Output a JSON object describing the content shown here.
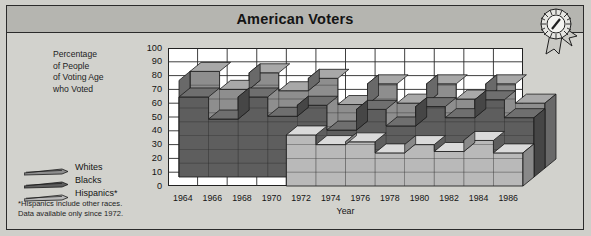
{
  "title": "American Voters",
  "badge": {
    "icon": "award-rosette-icon"
  },
  "y_axis_caption": [
    "Percentage",
    "of People",
    "of Voting Age",
    "who Voted"
  ],
  "legend": [
    {
      "label": "Whites",
      "color": "#8e8e8e",
      "swatch": "ribbon-swatch"
    },
    {
      "label": "Blacks",
      "color": "#5e5e5e",
      "swatch": "ribbon-swatch"
    },
    {
      "label": "Hispanics*",
      "color": "#b9b9b9",
      "swatch": "ribbon-swatch"
    }
  ],
  "footnote": [
    "*Hispanics include other races.",
    " Data available only since 1972."
  ],
  "chart_data": {
    "type": "area",
    "title": "American Voters",
    "xlabel": "Year",
    "ylabel": "Percentage of People of Voting Age who Voted",
    "ylim": [
      0,
      100
    ],
    "yticks": [
      0,
      10,
      20,
      30,
      40,
      50,
      60,
      70,
      80,
      90,
      100
    ],
    "grid": true,
    "legend_position": "left",
    "categories": [
      1964,
      1966,
      1968,
      1970,
      1972,
      1974,
      1976,
      1978,
      1980,
      1982,
      1984,
      1986
    ],
    "series": [
      {
        "name": "Whites",
        "color": "#8e8e8e",
        "values": [
          70,
          57,
          69,
          56,
          65,
          46,
          61,
          47,
          61,
          50,
          61,
          47
        ]
      },
      {
        "name": "Blacks",
        "color": "#5e5e5e",
        "values": [
          58,
          42,
          58,
          44,
          52,
          34,
          49,
          37,
          51,
          43,
          56,
          43
        ]
      },
      {
        "name": "Hispanics*",
        "color": "#b9b9b9",
        "values": [
          null,
          null,
          null,
          null,
          37,
          30,
          32,
          24,
          30,
          25,
          33,
          24
        ]
      }
    ],
    "notes": "Hispanics include other races. Data available only since 1972."
  }
}
